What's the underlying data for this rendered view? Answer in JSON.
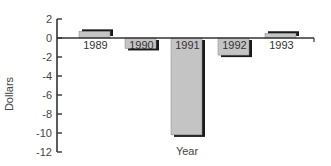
{
  "chart_data": {
    "type": "bar",
    "title": "",
    "xlabel": "Year",
    "ylabel": "Dollars",
    "categories": [
      "1989",
      "1990",
      "1991",
      "1992",
      "1993"
    ],
    "values": [
      0.7,
      -1.1,
      -10.2,
      -1.8,
      0.5
    ],
    "ylim": [
      -12,
      2
    ],
    "yticks": [
      2,
      0,
      -2,
      -4,
      -6,
      -8,
      -10,
      -12
    ],
    "grid": false,
    "legend": "none",
    "bar_color": "#c4c4c4",
    "shadow_color": "#1a1a1a",
    "axis_color": "#333333"
  }
}
